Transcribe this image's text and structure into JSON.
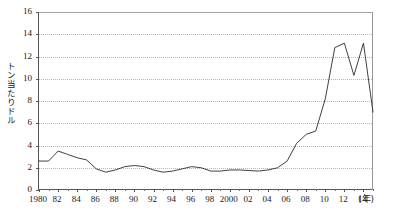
{
  "chart_data": {
    "type": "line",
    "title": "",
    "xlabel": "(年)",
    "ylabel": "トン当たりドル",
    "ylim": [
      0,
      16
    ],
    "xlim": [
      1980,
      2015
    ],
    "ytick_step": 2,
    "grid": true,
    "legend": false,
    "line_color": "#2b2b2b",
    "ytick_labels": [
      "0",
      "2",
      "4",
      "6",
      "8",
      "10",
      "12",
      "14",
      "16"
    ],
    "ytick_values": [
      0,
      2,
      4,
      6,
      8,
      10,
      12,
      14,
      16
    ],
    "xtick_labels": [
      "1980",
      "82",
      "84",
      "86",
      "88",
      "90",
      "92",
      "94",
      "96",
      "98",
      "2000",
      "02",
      "04",
      "06",
      "08",
      "10",
      "12",
      "14"
    ],
    "xtick_values": [
      1980,
      1982,
      1984,
      1986,
      1988,
      1990,
      1992,
      1994,
      1996,
      1998,
      2000,
      2002,
      2004,
      2006,
      2008,
      2010,
      2012,
      2014
    ],
    "x": [
      1980,
      1981,
      1982,
      1983,
      1984,
      1985,
      1986,
      1987,
      1988,
      1989,
      1990,
      1991,
      1992,
      1993,
      1994,
      1995,
      1996,
      1997,
      1998,
      1999,
      2000,
      2001,
      2002,
      2003,
      2004,
      2005,
      2006,
      2007,
      2008,
      2009,
      2010,
      2011,
      2012,
      2013,
      2014,
      2015
    ],
    "values": [
      2.6,
      2.6,
      3.5,
      3.2,
      2.9,
      2.7,
      1.9,
      1.6,
      1.8,
      2.1,
      2.2,
      2.1,
      1.8,
      1.6,
      1.7,
      1.9,
      2.1,
      2.0,
      1.7,
      1.7,
      1.8,
      1.8,
      1.75,
      1.7,
      1.8,
      2.0,
      2.6,
      4.2,
      5.0,
      5.3,
      8.2,
      12.8,
      13.2,
      10.3,
      13.2,
      7.0
    ],
    "series_name": "トン当たりドル"
  }
}
